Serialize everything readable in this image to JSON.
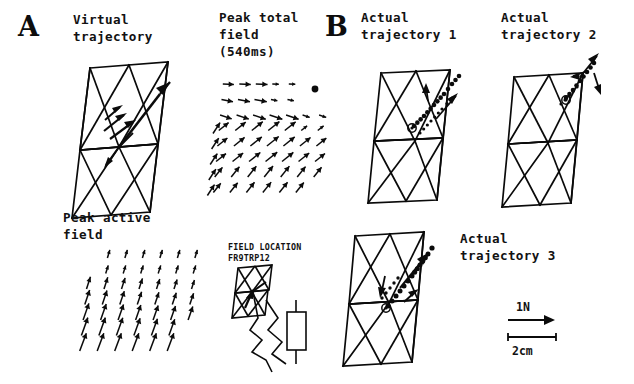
{
  "figure": {
    "background_color": "#ffffff",
    "ink_color": "#0b0b0b",
    "width": 634,
    "height": 384
  },
  "panels": {
    "a": {
      "letter": "A",
      "subpanels": {
        "virtual_trajectory": {
          "label_line1": "Virtual",
          "label_line2": "trajectory"
        },
        "peak_total_field": {
          "label_line1": "Peak total",
          "label_line2": "field",
          "label_line3": "(540ms)"
        },
        "peak_active_field": {
          "label_line1": "Peak active",
          "label_line2": "field"
        },
        "field_location": {
          "label_line1": "FIELD LOCATION",
          "label_line2": "FR9TRP12"
        }
      }
    },
    "b": {
      "letter": "B",
      "subpanels": {
        "actual_trajectory_1": {
          "label_line1": "Actual",
          "label_line2": "trajectory 1"
        },
        "actual_trajectory_2": {
          "label_line1": "Actual",
          "label_line2": "trajectory 2"
        },
        "actual_trajectory_3": {
          "label_line1": "Actual",
          "label_line2": "trajectory 3"
        }
      }
    }
  },
  "scale_legend": {
    "force_label": "1N",
    "distance_label": "2cm"
  },
  "chart_data": {
    "type": "scatter",
    "xlabel": "",
    "ylabel": "",
    "scale_force_newtons": 1,
    "scale_distance_cm": 2,
    "peak_total_field_time_ms": 540,
    "field_location_code": "FR9TRP12",
    "series": [
      {
        "name": "Virtual trajectory",
        "type": "arrow-path",
        "points": [
          [
            0.5,
            0.52
          ],
          [
            0.58,
            0.44
          ],
          [
            0.68,
            0.34
          ],
          [
            0.8,
            0.22
          ],
          [
            0.9,
            0.13
          ]
        ]
      },
      {
        "name": "Actual trajectory 1",
        "type": "dotted-path",
        "start_marker": "circled-dot",
        "points": [
          [
            0.46,
            0.62
          ],
          [
            0.54,
            0.54
          ],
          [
            0.62,
            0.46
          ],
          [
            0.7,
            0.38
          ],
          [
            0.78,
            0.3
          ],
          [
            0.86,
            0.22
          ],
          [
            0.93,
            0.15
          ]
        ]
      },
      {
        "name": "Actual trajectory 2",
        "type": "dotted-path",
        "start_marker": "circled-dot",
        "points": [
          [
            0.55,
            0.5
          ],
          [
            0.63,
            0.42
          ],
          [
            0.71,
            0.34
          ],
          [
            0.79,
            0.26
          ],
          [
            0.88,
            0.17
          ],
          [
            0.96,
            0.08
          ]
        ]
      },
      {
        "name": "Actual trajectory 3",
        "type": "dotted-path",
        "start_marker": "circled-dot",
        "points": [
          [
            0.44,
            0.66
          ],
          [
            0.52,
            0.58
          ],
          [
            0.6,
            0.5
          ],
          [
            0.68,
            0.41
          ],
          [
            0.76,
            0.32
          ],
          [
            0.85,
            0.22
          ],
          [
            0.93,
            0.13
          ]
        ]
      },
      {
        "name": "Peak total field",
        "type": "vector-field",
        "pattern": "convergent",
        "grid_cols": 7,
        "grid_rows": 8
      },
      {
        "name": "Peak active field",
        "type": "vector-field",
        "pattern": "upward-parallel",
        "grid_cols": 7,
        "grid_rows": 7
      }
    ]
  }
}
